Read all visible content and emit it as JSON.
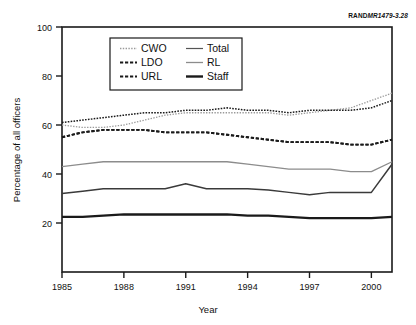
{
  "figure": {
    "source_tag_prefix": "RAND",
    "source_tag_id": "MR1479-3.28"
  },
  "chart_data": {
    "type": "line",
    "title": "",
    "xlabel": "Year",
    "ylabel": "Percentage of all officers",
    "xlim": [
      1985,
      2001
    ],
    "ylim": [
      0,
      100
    ],
    "yticks": [
      20,
      40,
      60,
      80,
      100
    ],
    "ytick_labels": [
      "20",
      "40",
      "60",
      "80",
      "100"
    ],
    "xticks": [
      1985,
      1988,
      1991,
      1994,
      1997,
      2000
    ],
    "xtick_labels": [
      "1985",
      "1988",
      "1991",
      "1994",
      "1997",
      "2000"
    ],
    "grid": false,
    "legend_position": "upper-left-inside",
    "x": [
      1985,
      1986,
      1987,
      1988,
      1989,
      1990,
      1991,
      1992,
      1993,
      1994,
      1995,
      1996,
      1997,
      1998,
      1999,
      2000,
      2001
    ],
    "series": [
      {
        "name": "CWO",
        "style": "dotted-light",
        "color": "#aaaaaa",
        "values": [
          60,
          59,
          59,
          60,
          62,
          64,
          65,
          65,
          65,
          65,
          65,
          64,
          65,
          66,
          67,
          70,
          73
        ]
      },
      {
        "name": "Total",
        "style": "dotted-dark",
        "color": "#222222",
        "values": [
          61,
          62,
          63,
          64,
          65,
          65,
          66,
          66,
          67,
          66,
          66,
          65,
          66,
          66,
          66,
          67,
          70
        ]
      },
      {
        "name": "LDO",
        "style": "dashed",
        "color": "#222222",
        "values": [
          55,
          57,
          58,
          58,
          58,
          57,
          57,
          57,
          56,
          55,
          54,
          53,
          53,
          53,
          52,
          52,
          54
        ]
      },
      {
        "name": "URL",
        "style": "dashed",
        "color": "#222222",
        "values": [
          55,
          57,
          58,
          58,
          58,
          57,
          57,
          57,
          56,
          55,
          54,
          53,
          53,
          53,
          52,
          52,
          54
        ]
      },
      {
        "name": "RL",
        "style": "solid-gray",
        "color": "#808080",
        "values": [
          43,
          44,
          45,
          45,
          45,
          45,
          45,
          45,
          45,
          44,
          43,
          42,
          42,
          42,
          41,
          41,
          45
        ]
      },
      {
        "name": "Staff",
        "style": "solid-thick",
        "color": "#1a1a1a",
        "values": [
          22.5,
          22.5,
          23,
          23.5,
          23.5,
          23.5,
          23.5,
          23.5,
          23.5,
          23,
          23,
          22.5,
          22,
          22,
          22,
          22,
          22.5
        ]
      }
    ],
    "extra_series": [
      {
        "name": "LDO-lower",
        "style": "solid-dark-thin",
        "color": "#3a3a3a",
        "values": [
          32,
          33,
          34,
          34,
          34,
          34,
          36,
          34,
          34,
          34,
          33.5,
          32.5,
          31.5,
          32.5,
          32.5,
          32.5,
          44
        ]
      }
    ]
  },
  "legend": {
    "entries": [
      {
        "label": "CWO",
        "swatch": "dotted-light"
      },
      {
        "label": "Total",
        "swatch": "solid-thin"
      },
      {
        "label": "LDO",
        "swatch": "dashed-dark"
      },
      {
        "label": "RL",
        "swatch": "solid-gray"
      },
      {
        "label": "URL",
        "swatch": "dashed-dark"
      },
      {
        "label": "Staff",
        "swatch": "solid-thick"
      }
    ]
  }
}
